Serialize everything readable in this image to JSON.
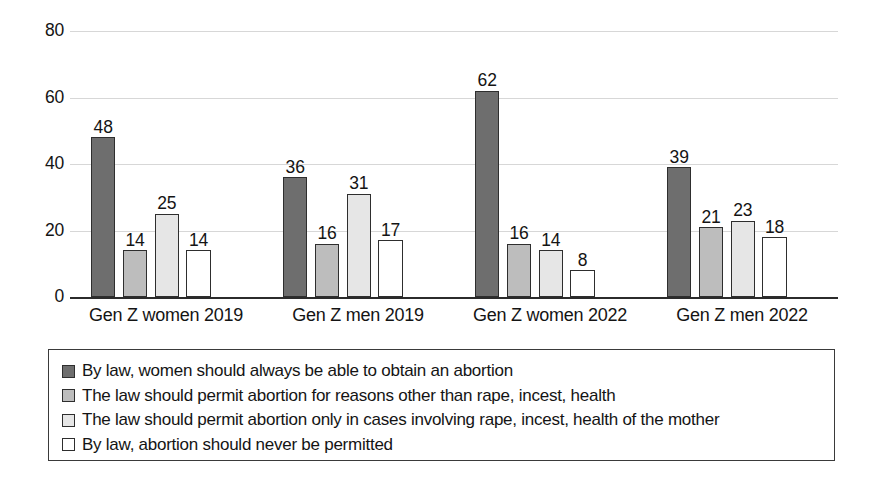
{
  "chart_data": {
    "type": "bar",
    "title": "",
    "subtitle": "",
    "xlabel": "",
    "ylabel": "",
    "ylim": [
      0,
      80
    ],
    "yticks": [
      0,
      20,
      40,
      60,
      80
    ],
    "grid": "horizontal",
    "legend_position": "bottom",
    "data_labels": true,
    "categories": [
      "Gen Z women 2019",
      "Gen Z men 2019",
      "Gen Z women 2022",
      "Gen Z men 2022"
    ],
    "series": [
      {
        "name": "By law, women should always be able to obtain an abortion",
        "color": "#6e6e6e",
        "values": [
          48,
          36,
          62,
          39
        ]
      },
      {
        "name": "The law should permit abortion for reasons other than rape, incest, health",
        "color": "#bdbdbd",
        "values": [
          14,
          16,
          16,
          21
        ]
      },
      {
        "name": "The law should permit abortion only in cases involving rape, incest, health of the mother",
        "color": "#e6e6e6",
        "values": [
          25,
          31,
          14,
          23
        ]
      },
      {
        "name": "By law, abortion should never be permitted",
        "color": "#ffffff",
        "values": [
          14,
          17,
          8,
          18
        ]
      }
    ]
  }
}
